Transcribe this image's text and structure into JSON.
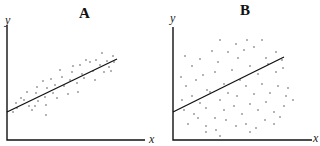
{
  "chart_data": [
    {
      "type": "scatter",
      "title": "A",
      "xlabel": "x",
      "ylabel": "y",
      "grid": false,
      "legend": null,
      "axis_ticks": false,
      "description": "Tight positive correlation; points cluster closely around a linear regression line",
      "frame": {
        "origin": [
          7,
          140
        ],
        "x_end": 145,
        "y_top": 25
      },
      "regression_line": {
        "x1": 7,
        "y1": 112,
        "x2": 117,
        "y2": 59
      },
      "points": [
        [
          13,
          112
        ],
        [
          17,
          108
        ],
        [
          16,
          103
        ],
        [
          21,
          98
        ],
        [
          27,
          92
        ],
        [
          24,
          100
        ],
        [
          29,
          106
        ],
        [
          32,
          110
        ],
        [
          35,
          106
        ],
        [
          38,
          101
        ],
        [
          36,
          93
        ],
        [
          37,
          87
        ],
        [
          43,
          81
        ],
        [
          47,
          88
        ],
        [
          45,
          97
        ],
        [
          46,
          105
        ],
        [
          46,
          115
        ],
        [
          51,
          79
        ],
        [
          55,
          85
        ],
        [
          53,
          93
        ],
        [
          57,
          98
        ],
        [
          60,
          70
        ],
        [
          62,
          77
        ],
        [
          64,
          86
        ],
        [
          68,
          94
        ],
        [
          70,
          80
        ],
        [
          72,
          72
        ],
        [
          73,
          66
        ],
        [
          77,
          83
        ],
        [
          78,
          92
        ],
        [
          80,
          65
        ],
        [
          82,
          74
        ],
        [
          84,
          78
        ],
        [
          86,
          60
        ],
        [
          90,
          62
        ],
        [
          93,
          71
        ],
        [
          95,
          80
        ],
        [
          96,
          60
        ],
        [
          100,
          65
        ],
        [
          102,
          53
        ],
        [
          104,
          72
        ],
        [
          107,
          61
        ],
        [
          109,
          67
        ],
        [
          111,
          71
        ],
        [
          113,
          56
        ],
        [
          114,
          62
        ]
      ],
      "point_color": "#444444"
    },
    {
      "type": "scatter",
      "title": "B",
      "xlabel": "x",
      "ylabel": "y",
      "grid": false,
      "legend": null,
      "axis_ticks": false,
      "description": "Weak positive correlation; points widely scattered around a linear regression line",
      "frame": {
        "origin": [
          173,
          140
        ],
        "x_end": 312,
        "y_top": 27
      },
      "regression_line": {
        "x1": 173,
        "y1": 112,
        "x2": 284,
        "y2": 57
      },
      "points": [
        [
          185,
          56
        ],
        [
          200,
          59
        ],
        [
          220,
          40
        ],
        [
          236,
          44
        ],
        [
          247,
          40
        ],
        [
          262,
          40
        ],
        [
          181,
          77
        ],
        [
          192,
          66
        ],
        [
          203,
          75
        ],
        [
          212,
          51
        ],
        [
          218,
          62
        ],
        [
          228,
          52
        ],
        [
          238,
          58
        ],
        [
          244,
          50
        ],
        [
          254,
          47
        ],
        [
          266,
          58
        ],
        [
          276,
          52
        ],
        [
          282,
          60
        ],
        [
          186,
          86
        ],
        [
          196,
          80
        ],
        [
          207,
          90
        ],
        [
          215,
          72
        ],
        [
          224,
          84
        ],
        [
          232,
          70
        ],
        [
          240,
          80
        ],
        [
          250,
          66
        ],
        [
          258,
          74
        ],
        [
          268,
          64
        ],
        [
          276,
          72
        ],
        [
          283,
          68
        ],
        [
          288,
          88
        ],
        [
          182,
          100
        ],
        [
          192,
          96
        ],
        [
          200,
          103
        ],
        [
          210,
          92
        ],
        [
          220,
          100
        ],
        [
          228,
          93
        ],
        [
          237,
          96
        ],
        [
          246,
          86
        ],
        [
          254,
          94
        ],
        [
          262,
          84
        ],
        [
          270,
          93
        ],
        [
          278,
          86
        ],
        [
          286,
          96
        ],
        [
          184,
          110
        ],
        [
          194,
          114
        ],
        [
          206,
          108
        ],
        [
          215,
          118
        ],
        [
          224,
          110
        ],
        [
          234,
          106
        ],
        [
          242,
          114
        ],
        [
          250,
          104
        ],
        [
          258,
          110
        ],
        [
          266,
          102
        ],
        [
          274,
          112
        ],
        [
          284,
          106
        ],
        [
          293,
          100
        ],
        [
          188,
          124
        ],
        [
          198,
          118
        ],
        [
          206,
          126
        ],
        [
          216,
          130
        ],
        [
          226,
          120
        ],
        [
          236,
          126
        ],
        [
          246,
          124
        ],
        [
          256,
          128
        ],
        [
          265,
          120
        ],
        [
          274,
          124
        ],
        [
          280,
          117
        ],
        [
          206,
          132
        ],
        [
          220,
          136
        ],
        [
          250,
          132
        ]
      ],
      "point_color": "#444444"
    }
  ],
  "panels": {
    "a": {
      "title": "A",
      "xlabel": "x",
      "ylabel": "y"
    },
    "b": {
      "title": "B",
      "xlabel": "x",
      "ylabel": "y"
    }
  }
}
